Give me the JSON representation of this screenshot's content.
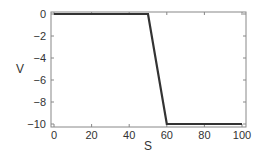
{
  "chart_data": {
    "type": "line",
    "title": "",
    "xlabel": "S",
    "ylabel": "V",
    "xlim": [
      0,
      100
    ],
    "ylim": [
      -10,
      0
    ],
    "xticks": [
      0,
      20,
      40,
      60,
      80,
      100
    ],
    "yticks": [
      0,
      -2,
      -4,
      -6,
      -8,
      -10
    ],
    "xtick_labels": [
      "0",
      "20",
      "40",
      "60",
      "80",
      "100"
    ],
    "ytick_labels": [
      "0",
      "−2",
      "−4",
      "−6",
      "−8",
      "−10"
    ],
    "grid": false,
    "legend": null,
    "series": [
      {
        "name": "V(S)",
        "color": "#333333",
        "x": [
          0,
          50,
          60,
          100
        ],
        "y": [
          0,
          0,
          -10,
          -10
        ]
      }
    ]
  },
  "style": {
    "frame_color": "#888888",
    "line_color": "#333333",
    "text_color": "#333333"
  }
}
